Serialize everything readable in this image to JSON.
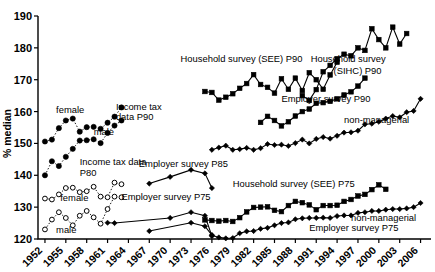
{
  "chart_data": {
    "type": "scatter",
    "title": "",
    "xlabel": "",
    "ylabel": "% median",
    "xlim": [
      1951,
      2007.5
    ],
    "ylim": [
      120,
      190
    ],
    "grid": false,
    "legend_position": "inline-annotations",
    "xticks": [
      "1952",
      "1955",
      "1958",
      "1961",
      "1964",
      "1967",
      "1970",
      "1973",
      "1976",
      "1979",
      "1982",
      "1985",
      "1988",
      "1991",
      "1994",
      "1997",
      "2000",
      "2003",
      "2006"
    ],
    "yticks": [
      "120",
      "130",
      "140",
      "150",
      "160",
      "170",
      "180",
      "190"
    ],
    "annotations": [
      {
        "text": "female",
        "x": 1953.6,
        "y": 159.6,
        "name": "annot-female-top"
      },
      {
        "text": "male",
        "x": 1959.0,
        "y": 152.5,
        "name": "annot-male-top"
      },
      {
        "text": "Income tax",
        "x": 1962.2,
        "y": 160.6,
        "name": "annot-income-tax-1"
      },
      {
        "text": "data P90",
        "x": 1962.2,
        "y": 157.3,
        "name": "annot-income-tax-2"
      },
      {
        "text": "Income tax data",
        "x": 1957.0,
        "y": 143.2,
        "name": "annot-income-tax-p80-1"
      },
      {
        "text": "P80",
        "x": 1957.0,
        "y": 139.8,
        "name": "annot-income-tax-p80-2"
      },
      {
        "text": "female",
        "x": 1954.2,
        "y": 132.0,
        "name": "annot-female-bottom"
      },
      {
        "text": "male",
        "x": 1953.6,
        "y": 121.8,
        "name": "annot-male-bottom"
      },
      {
        "text": "Employer survey P85",
        "x": 1965.5,
        "y": 142.6,
        "name": "annot-employer-p85"
      },
      {
        "text": "Employer survey P75",
        "x": 1963.0,
        "y": 132.2,
        "name": "annot-employer-p75-left"
      },
      {
        "text": "Household survey (SEE) P90",
        "x": 1971.5,
        "y": 175.5,
        "name": "annot-household-see-p90"
      },
      {
        "text": "Household survey",
        "x": 1990.2,
        "y": 175.5,
        "name": "annot-household-sihc-p90-1"
      },
      {
        "text": "(SIHC) P90",
        "x": 1993.5,
        "y": 171.8,
        "name": "annot-household-sihc-p90-2"
      },
      {
        "text": "Employer survey P90",
        "x": 1986.0,
        "y": 163.0,
        "name": "annot-employer-p90"
      },
      {
        "text": "non-managerial",
        "x": 1995.0,
        "y": 156.5,
        "name": "annot-nonmanagerial-top"
      },
      {
        "text": "Household survey (SEE)  P75",
        "x": 1979.0,
        "y": 136.3,
        "name": "annot-household-see-p75"
      },
      {
        "text": "non-managerial",
        "x": 1996.0,
        "y": 125.5,
        "name": "annot-nonmanagerial-bottom"
      },
      {
        "text": "Employer survey P75",
        "x": 1990.0,
        "y": 122.5,
        "name": "annot-employer-p75-right"
      }
    ],
    "series": [
      {
        "name": "Income tax data P90 female",
        "marker": "filled-circle",
        "line": "dotted",
        "x": [
          1952,
          1953,
          1954,
          1955,
          1956,
          1957,
          1958,
          1959,
          1960,
          1961,
          1962,
          1963
        ],
        "values": [
          150.6,
          151.2,
          154.8,
          157.2,
          157.8,
          153.7,
          155.1,
          155.2,
          154.6,
          156.5,
          158.4,
          161.3
        ]
      },
      {
        "name": "Income tax data P90 male",
        "marker": "filled-circle",
        "line": "dotted",
        "x": [
          1952,
          1953,
          1954,
          1955,
          1956,
          1957,
          1958,
          1959,
          1960,
          1961,
          1962,
          1963
        ],
        "values": [
          140.0,
          144.4,
          142.9,
          145.8,
          148.3,
          150.9,
          151.0,
          151.3,
          150.1,
          153.3,
          155.6,
          157.2
        ]
      },
      {
        "name": "Income tax data P80 female",
        "marker": "open-circle",
        "line": "dotted",
        "x": [
          1952,
          1953,
          1954,
          1955,
          1956,
          1957,
          1958,
          1959,
          1960,
          1961,
          1962,
          1963
        ],
        "values": [
          132.7,
          132.4,
          134.0,
          136.0,
          136.1,
          134.7,
          135.0,
          136.4,
          133.3,
          133.1,
          137.7,
          137.2
        ]
      },
      {
        "name": "Income tax data P80 male",
        "marker": "open-circle",
        "line": "dotted",
        "x": [
          1952,
          1953,
          1954,
          1955,
          1956,
          1957,
          1958,
          1959,
          1960,
          1961,
          1962,
          1963
        ],
        "values": [
          123.0,
          126.1,
          128.4,
          126.6,
          124.3,
          127.3,
          128.8,
          126.8,
          124.8,
          129.4,
          133.3,
          133.1
        ]
      },
      {
        "name": "Employer survey P85",
        "marker": "filled-diamond",
        "line": "solid",
        "x": [
          1967,
          1970,
          1973,
          1975,
          1976
        ],
        "values": [
          137.4,
          139.5,
          141.7,
          140.6,
          136.0
        ]
      },
      {
        "name": "Employer survey P75 early",
        "marker": "filled-diamond",
        "line": "solid",
        "x": [
          1961,
          1962,
          1970,
          1973,
          1975,
          1976
        ],
        "values": [
          125.1,
          125.0,
          126.6,
          128.4,
          127.3,
          120.9
        ]
      },
      {
        "name": "Employer survey P75 lower early",
        "marker": "filled-diamond",
        "line": "solid",
        "x": [
          1967,
          1973,
          1975,
          1976
        ],
        "values": [
          122.5,
          125.1,
          124.0,
          121.2
        ]
      },
      {
        "name": "Household survey (SEE) P90",
        "marker": "filled-square",
        "line": "solid",
        "x": [
          1975,
          1976,
          1977,
          1978,
          1979,
          1980,
          1981,
          1982,
          1983,
          1984,
          1985,
          1986,
          1987,
          1988,
          1989,
          1990,
          1991,
          1992,
          1993,
          1994
        ],
        "values": [
          166.3,
          166.0,
          163.6,
          164.5,
          165.6,
          167.3,
          168.8,
          171.6,
          168.5,
          167.6,
          165.8,
          170.3,
          167.0,
          170.5,
          166.6,
          172.2,
          170.0,
          167.0,
          171.5,
          175.5
        ]
      },
      {
        "name": "Household survey (SIHC) P90",
        "marker": "filled-square",
        "line": "solid",
        "x": [
          1989,
          1990,
          1991,
          1992,
          1993,
          1994,
          1995,
          1996,
          1997,
          1998,
          1999,
          2000,
          2001,
          2002,
          2003,
          2004
        ],
        "values": [
          165.0,
          163.5,
          166.9,
          172.5,
          174.5,
          176.6,
          178.0,
          177.5,
          180.0,
          179.2,
          186.0,
          182.6,
          180.0,
          186.5,
          181.2,
          184.5
        ]
      },
      {
        "name": "Employer survey P90",
        "marker": "filled-square",
        "line": "solid",
        "x": [
          1983,
          1984,
          1985,
          1986,
          1987,
          1988,
          1989,
          1990,
          1991,
          1992,
          1993,
          1994,
          1995,
          1996,
          1997,
          1998
        ],
        "values": [
          156.6,
          158.5,
          157.2,
          155.5,
          156.8,
          158.6,
          160.0,
          160.8,
          162.6,
          162.8,
          163.2,
          164.0,
          165.2,
          166.2,
          168.0,
          170.5
        ]
      },
      {
        "name": "Employer survey P90 non-managerial",
        "marker": "filled-diamond",
        "line": "solid",
        "x": [
          1976,
          1977,
          1978,
          1979,
          1980,
          1981,
          1982,
          1983,
          1984,
          1985,
          1986,
          1987,
          1988,
          1989,
          1990,
          1991,
          1992,
          1993,
          1994,
          1995,
          1996,
          1997,
          1998,
          1999,
          2000,
          2001,
          2002,
          2003,
          2004,
          2005,
          2006
        ],
        "values": [
          148.0,
          148.7,
          149.3,
          148.0,
          148.2,
          148.6,
          148.0,
          148.5,
          149.8,
          149.5,
          149.6,
          149.2,
          150.1,
          151.2,
          150.0,
          151.4,
          152.0,
          151.5,
          152.4,
          153.4,
          153.5,
          154.0,
          156.0,
          156.2,
          156.8,
          157.8,
          158.6,
          158.2,
          159.8,
          160.2,
          164.0
        ]
      },
      {
        "name": "Household survey (SEE) P75",
        "marker": "filled-square",
        "line": "solid",
        "x": [
          1975,
          1976,
          1977,
          1978,
          1979,
          1980,
          1981,
          1982,
          1983,
          1984,
          1985,
          1986,
          1987,
          1988,
          1989,
          1990,
          1991,
          1992,
          1993,
          1994,
          1995,
          1996,
          1997,
          1998,
          1999,
          2000,
          2001
        ],
        "values": [
          126.0,
          125.8,
          125.6,
          125.8,
          125.5,
          126.7,
          128.5,
          129.9,
          130.0,
          130.1,
          129.0,
          128.6,
          130.5,
          131.8,
          131.4,
          130.7,
          129.2,
          130.5,
          130.5,
          130.6,
          131.8,
          132.4,
          133.5,
          134.0,
          135.5,
          137.0,
          135.6
        ]
      },
      {
        "name": "Employer survey P75 non-managerial",
        "marker": "filled-diamond",
        "line": "solid",
        "x": [
          1976,
          1977,
          1978,
          1979,
          1980,
          1981,
          1982,
          1983,
          1984,
          1985,
          1986,
          1987,
          1988,
          1989,
          1990,
          1991,
          1992,
          1993,
          1994,
          1995,
          1996,
          1997,
          1998,
          1999,
          2000,
          2001,
          2002,
          2003,
          2004,
          2005,
          2006
        ],
        "values": [
          121.2,
          120.5,
          120.2,
          120.3,
          121.8,
          122.4,
          122.5,
          123.2,
          123.5,
          124.3,
          125.0,
          125.2,
          126.2,
          126.5,
          126.6,
          126.6,
          126.7,
          126.6,
          127.2,
          127.4,
          127.4,
          128.2,
          128.4,
          128.8,
          128.8,
          129.2,
          129.4,
          129.4,
          129.6,
          130.0,
          131.3
        ]
      }
    ]
  }
}
